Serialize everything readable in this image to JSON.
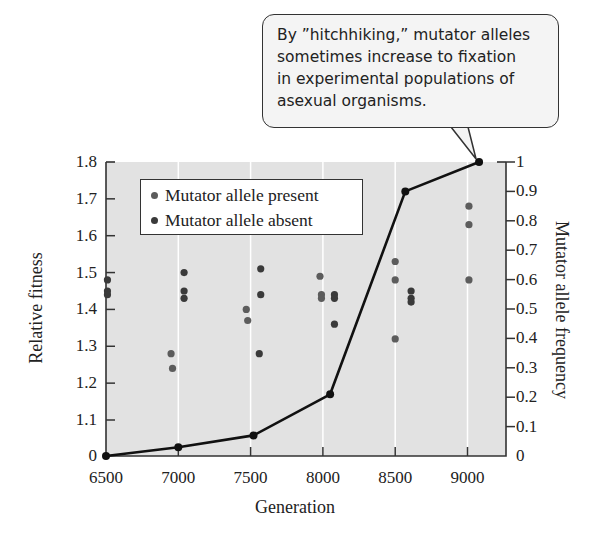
{
  "callout": {
    "lines": [
      "By ”hitchhiking,” mutator alleles",
      "sometimes increase to fixation",
      "in experimental populations of",
      "asexual organisms."
    ]
  },
  "legend": {
    "items": [
      {
        "label": "Mutator allele present",
        "color": "#5c5c5c"
      },
      {
        "label": "Mutator allele absent",
        "color": "#3a3a3a"
      }
    ]
  },
  "axes": {
    "xlabel": "Generation",
    "ylabel_left": "Relative fitness",
    "ylabel_right": "Mutator allele frequency",
    "x_ticks": [
      "6500",
      "7000",
      "7500",
      "8000",
      "8500",
      "9000"
    ],
    "y_left_ticks": [
      "0",
      "1.1",
      "1.2",
      "1.3",
      "1.4",
      "1.5",
      "1.6",
      "1.7",
      "1.8"
    ],
    "y_right_ticks": [
      "0",
      "0.1",
      "0.2",
      "0.3",
      "0.4",
      "0.5",
      "0.6",
      "0.7",
      "0.8",
      "0.9",
      "1"
    ]
  },
  "colors": {
    "plot_bg": "#e2e2e2",
    "gridline": "#ffffff",
    "line": "#111111",
    "present": "#5c5c5c",
    "absent": "#3a3a3a",
    "axis": "#333333"
  },
  "chart_data": {
    "type": "scatter+line",
    "title": "",
    "xlabel": "Generation",
    "ylabel": "Relative fitness",
    "y2label": "Mutator allele frequency",
    "xlim": [
      6500,
      9250
    ],
    "ylim": [
      1.0,
      1.8
    ],
    "y2lim": [
      0,
      1
    ],
    "grid": "vertical white lines at x ticks",
    "legend_position": "upper left",
    "annotation": "By ”hitchhiking,” mutator alleles sometimes increase to fixation in experimental populations of asexual organisms.",
    "series": [
      {
        "name": "Mutator allele present",
        "type": "scatter",
        "axis": "left",
        "points": [
          {
            "x": 6950,
            "y": 1.28
          },
          {
            "x": 6960,
            "y": 1.24
          },
          {
            "x": 7470,
            "y": 1.4
          },
          {
            "x": 7480,
            "y": 1.37
          },
          {
            "x": 7980,
            "y": 1.49
          },
          {
            "x": 7990,
            "y": 1.44
          },
          {
            "x": 7990,
            "y": 1.43
          },
          {
            "x": 8500,
            "y": 1.53
          },
          {
            "x": 8500,
            "y": 1.48
          },
          {
            "x": 8500,
            "y": 1.32
          },
          {
            "x": 9010,
            "y": 1.68
          },
          {
            "x": 9010,
            "y": 1.63
          },
          {
            "x": 9010,
            "y": 1.48
          }
        ]
      },
      {
        "name": "Mutator allele absent",
        "type": "scatter",
        "axis": "left",
        "points": [
          {
            "x": 6510,
            "y": 1.48
          },
          {
            "x": 6510,
            "y": 1.45
          },
          {
            "x": 6510,
            "y": 1.44
          },
          {
            "x": 7040,
            "y": 1.5
          },
          {
            "x": 7040,
            "y": 1.45
          },
          {
            "x": 7040,
            "y": 1.43
          },
          {
            "x": 7570,
            "y": 1.51
          },
          {
            "x": 7570,
            "y": 1.44
          },
          {
            "x": 7560,
            "y": 1.28
          },
          {
            "x": 8080,
            "y": 1.44
          },
          {
            "x": 8080,
            "y": 1.43
          },
          {
            "x": 8080,
            "y": 1.36
          },
          {
            "x": 8610,
            "y": 1.45
          },
          {
            "x": 8610,
            "y": 1.43
          },
          {
            "x": 8610,
            "y": 1.42
          }
        ]
      },
      {
        "name": "Mutator allele frequency",
        "type": "line",
        "axis": "right",
        "points": [
          {
            "x": 6500,
            "y": 0.0
          },
          {
            "x": 7000,
            "y": 0.03
          },
          {
            "x": 7520,
            "y": 0.07
          },
          {
            "x": 8050,
            "y": 0.21
          },
          {
            "x": 8570,
            "y": 0.9
          },
          {
            "x": 9080,
            "y": 1.0
          }
        ]
      }
    ]
  }
}
